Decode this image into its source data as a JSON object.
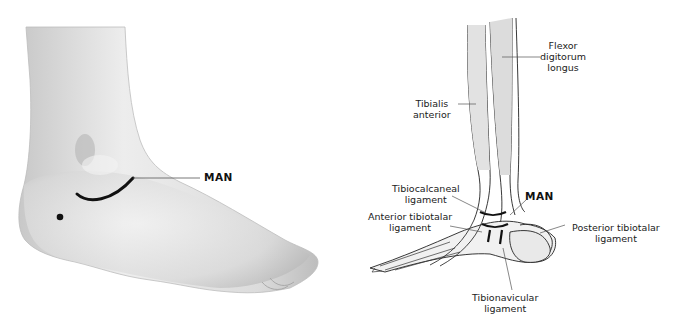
{
  "left_panel": {
    "marker_label": "MAN"
  },
  "right_panel": {
    "labels": {
      "flexor": [
        "Flexor",
        "digitorum",
        "longus"
      ],
      "tibialis": [
        "Tibialis",
        "anterior"
      ],
      "tibiocalcaneal": [
        "Tibiocalcaneal",
        "ligament"
      ],
      "man": "MAN",
      "anterior_tibiotalar": [
        "Anterior tibiotalar",
        "ligament"
      ],
      "posterior_tibiotalar": [
        "Posterior tibiotalar",
        "ligament"
      ],
      "tibionavicular": [
        "Tibionavicular",
        "ligament"
      ]
    }
  },
  "colors": {
    "skin_light": "#ececec",
    "skin_shadow": "#b9b9b9",
    "ink": "#111111",
    "leader": "#555555"
  }
}
